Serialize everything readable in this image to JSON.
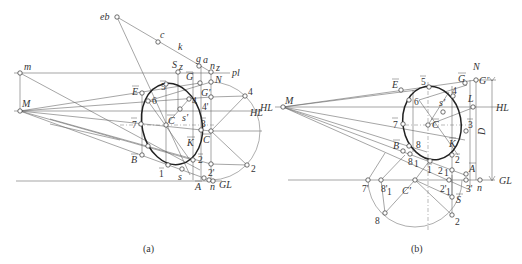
{
  "figure": {
    "panels": [
      {
        "id": "a",
        "caption": "(a)",
        "lines_labels": {
          "picture_line": "pl",
          "horizon": "HL",
          "ground": "GL"
        },
        "points": [
          {
            "name": "eb",
            "x": 117,
            "y": 17
          },
          {
            "name": "c",
            "x": 158,
            "y": 42
          },
          {
            "name": "k",
            "x": 180,
            "y": 53
          },
          {
            "name": "g",
            "x": 199,
            "y": 66
          },
          {
            "name": "a",
            "x": 204,
            "y": 66
          },
          {
            "name": "n_z",
            "x": 211,
            "y": 72
          },
          {
            "name": "m",
            "x": 20,
            "y": 73
          },
          {
            "name": "S_z",
            "x": 178,
            "y": 72
          },
          {
            "name": "Ḡ",
            "x": 193,
            "y": 72
          },
          {
            "name": "N",
            "x": 211,
            "y": 82
          },
          {
            "name": "G'",
            "x": 200,
            "y": 83
          },
          {
            "name": "Ē",
            "x": 142,
            "y": 93
          },
          {
            "name": "5̄",
            "x": 166,
            "y": 84
          },
          {
            "name": "6",
            "x": 148,
            "y": 101
          },
          {
            "name": "4̄",
            "x": 189,
            "y": 99
          },
          {
            "name": "4'",
            "x": 211,
            "y": 97
          },
          {
            "name": "4",
            "x": 245,
            "y": 96
          },
          {
            "name": "M",
            "x": 20,
            "y": 111
          },
          {
            "name": "s'",
            "x": 180,
            "y": 109
          },
          {
            "name": "7̄",
            "x": 141,
            "y": 124
          },
          {
            "name": "C̄",
            "x": 166,
            "y": 125
          },
          {
            "name": "3̄",
            "x": 201,
            "y": 126
          },
          {
            "name": "C",
            "x": 211,
            "y": 131
          },
          {
            "name": "K̄",
            "x": 193,
            "y": 142
          },
          {
            "name": "B̄",
            "x": 142,
            "y": 155
          },
          {
            "name": "1̄",
            "x": 168,
            "y": 165
          },
          {
            "name": "2̄",
            "x": 193,
            "y": 160
          },
          {
            "name": "2'",
            "x": 211,
            "y": 164
          },
          {
            "name": "2",
            "x": 247,
            "y": 165
          },
          {
            "name": "s",
            "x": 182,
            "y": 169
          },
          {
            "name": "Ā",
            "x": 204,
            "y": 178
          },
          {
            "name": "n",
            "x": 213,
            "y": 180
          }
        ],
        "labels": {
          "eb": "eb",
          "c": "c",
          "k": "k",
          "g": "g",
          "a": "a",
          "n_z": "n",
          "n_z_sub": "z",
          "m": "m",
          "S": "S",
          "S_sub": "z",
          "G_bar": "G",
          "N": "N",
          "G_prime": "G'",
          "E_bar": "E",
          "five_bar": "5",
          "six": "6",
          "four_bar": "4",
          "four_prime": "4'",
          "four": "4",
          "M": "M",
          "s_prime": "s'",
          "seven_bar": "7",
          "C_bar": "C",
          "three_bar": "3",
          "C": "C",
          "K_bar": "K",
          "B_bar": "B",
          "one_bar": "1",
          "two_bar": "2",
          "two_prime": "2'",
          "two": "2",
          "s": "s",
          "A_bar": "A",
          "n": "n"
        }
      },
      {
        "id": "b",
        "caption": "(b)",
        "lines_labels": {
          "horizon_left": "HL",
          "horizon_right": "HL",
          "ground": "GL",
          "distance": "D"
        },
        "labels": {
          "M": "M",
          "N": "N",
          "G_prime": "G'",
          "G_bar": "G",
          "E_bar": "E",
          "five_bar": "5",
          "four_bar": "4",
          "six": "6",
          "s_prime": "s'",
          "L": "L",
          "seven_bar": "7",
          "C_bar": "C",
          "three_bar": "3",
          "B_bar": "B",
          "eight": "8",
          "eight_one": "8",
          "eight_one_sub": "1",
          "K_bar": "K",
          "two_bar": "2",
          "one_bar": "1",
          "two_one": "2",
          "two_one_sub": "1",
          "A_bar": "A",
          "seven_prime": "7'",
          "eight_one_prime": "8'",
          "eight_one_prime_sub": "1",
          "C_prime": "C'",
          "two_one_prime": "2'",
          "two_one_prime_sub": "1",
          "three_prime": "3'",
          "n": "n",
          "S_bar": "S",
          "eight_low": "8",
          "two_low": "2"
        }
      }
    ]
  }
}
